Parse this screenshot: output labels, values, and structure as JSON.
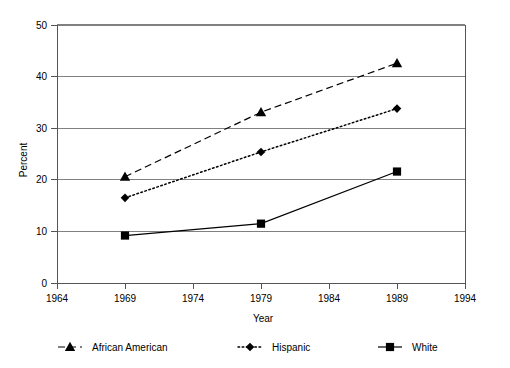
{
  "chart_data": {
    "type": "line",
    "title": "",
    "xlabel": "Year",
    "ylabel": "Percent",
    "x": [
      1969,
      1979,
      1989
    ],
    "xlim": [
      1964,
      1994
    ],
    "ylim": [
      0,
      50
    ],
    "xticks": [
      1964,
      1969,
      1974,
      1979,
      1984,
      1989,
      1994
    ],
    "yticks": [
      0,
      10,
      20,
      30,
      40,
      50
    ],
    "xtick_labels": [
      "1964",
      "1969",
      "1974",
      "1979",
      "1984",
      "1989",
      "1994"
    ],
    "ytick_labels": [
      "0",
      "10",
      "20",
      "30",
      "40",
      "50"
    ],
    "grid": "horizontal",
    "legend_position": "bottom",
    "series": [
      {
        "name": "African American",
        "values": [
          20.6,
          33.1,
          42.6
        ],
        "marker": "triangle",
        "linestyle": "dashed",
        "color": "#000000"
      },
      {
        "name": "Hispanic",
        "values": [
          16.5,
          25.4,
          33.8
        ],
        "marker": "diamond",
        "linestyle": "dotted",
        "color": "#000000"
      },
      {
        "name": "White",
        "values": [
          9.2,
          11.5,
          21.6
        ],
        "marker": "square",
        "linestyle": "solid",
        "color": "#000000"
      }
    ]
  },
  "legend": {
    "items": [
      {
        "label": "African American",
        "marker": "triangle-icon",
        "linestyle": "dashed"
      },
      {
        "label": "Hispanic",
        "marker": "diamond-icon",
        "linestyle": "dotted"
      },
      {
        "label": "White",
        "marker": "square-icon",
        "linestyle": "solid"
      }
    ]
  }
}
